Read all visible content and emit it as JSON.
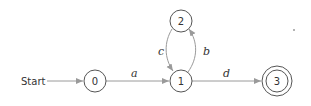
{
  "diagram": {
    "type": "finite-automaton",
    "start_label": "Start",
    "states": [
      {
        "id": "0",
        "label": "0",
        "accepting": false
      },
      {
        "id": "1",
        "label": "1",
        "accepting": false
      },
      {
        "id": "2",
        "label": "2",
        "accepting": false
      },
      {
        "id": "3",
        "label": "3",
        "accepting": true
      }
    ],
    "transitions": [
      {
        "from": "0",
        "to": "1",
        "label": "a"
      },
      {
        "from": "1",
        "to": "2",
        "label": "b"
      },
      {
        "from": "2",
        "to": "1",
        "label": "c"
      },
      {
        "from": "1",
        "to": "3",
        "label": "d"
      }
    ],
    "colors": {
      "edge": "#9a9a9a",
      "state_stroke": "#555555",
      "text": "#333333"
    }
  }
}
